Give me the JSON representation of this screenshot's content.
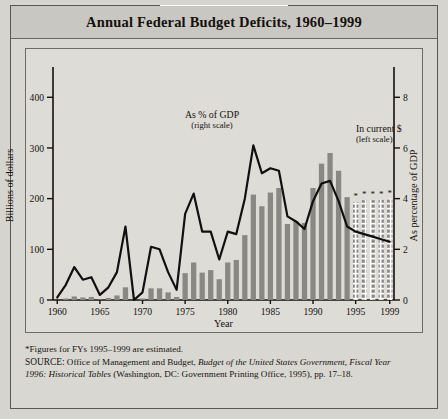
{
  "figure": {
    "title": "Annual Federal Budget Deficits, 1960–1999",
    "footnote": "*Figures for FYs 1995–1999 are estimated.",
    "source_label": "SOURCE:",
    "source_text_1": " Office of Management and Budget, ",
    "source_italic_1": "Budget of the United States Government, Fiscal Year",
    "source_italic_2": "1996: Historical Tables",
    "source_text_2": " (Washington, DC: Government Printing Office, 1995), pp. 17–18."
  },
  "annotations": {
    "line_label_1": "As % of GDP",
    "line_label_2": "(right scale)",
    "bar_label_1": "In current $",
    "bar_label_2": "(left scale)"
  },
  "colors": {
    "bar_fill": "#8a8884",
    "bar_estimated_fill": "#8a8884",
    "line_stroke": "#101010",
    "panel_bg": "#dedcd7",
    "frame": "#6e6c67",
    "title_bg": "#c9c7c2",
    "page_bg": "#d6d4cf"
  },
  "chart_data": {
    "type": "bar",
    "title": "Annual Federal Budget Deficits, 1960–1999",
    "xlabel": "Year",
    "ylabel": "Billions of dollars",
    "y2label": "As percentage of GDP",
    "ylim": [
      0,
      440
    ],
    "y2lim": [
      0,
      8.8
    ],
    "yticks": [
      0,
      100,
      200,
      300,
      400
    ],
    "y2ticks": [
      0,
      2,
      4,
      6,
      8
    ],
    "xticks": [
      1960,
      1965,
      1970,
      1975,
      1980,
      1985,
      1990,
      1995,
      1999
    ],
    "grid": false,
    "legend": "inline-annotations",
    "categories": [
      1960,
      1961,
      1962,
      1963,
      1964,
      1965,
      1966,
      1967,
      1968,
      1969,
      1970,
      1971,
      1972,
      1973,
      1974,
      1975,
      1976,
      1977,
      1978,
      1979,
      1980,
      1981,
      1982,
      1983,
      1984,
      1985,
      1986,
      1987,
      1988,
      1989,
      1990,
      1991,
      1992,
      1993,
      1994,
      1995,
      1996,
      1997,
      1998,
      1999
    ],
    "series": [
      {
        "name": "In current $ (left scale)",
        "axis": "left",
        "units": "Billions of dollars",
        "type": "bar",
        "values": [
          0,
          3,
          7,
          5,
          6,
          1,
          4,
          9,
          25,
          0,
          3,
          23,
          23,
          15,
          6,
          53,
          74,
          54,
          59,
          41,
          74,
          79,
          128,
          208,
          185,
          212,
          221,
          150,
          155,
          152,
          221,
          269,
          290,
          255,
          203,
          193,
          197,
          197,
          198,
          200
        ],
        "estimated_from": 1995
      },
      {
        "name": "As % of GDP (right scale)",
        "axis": "right",
        "units": "Percent of GDP",
        "type": "line",
        "values": [
          0.1,
          0.6,
          1.3,
          0.8,
          0.9,
          0.2,
          0.5,
          1.1,
          2.9,
          0.0,
          0.3,
          2.1,
          2.0,
          1.1,
          0.4,
          3.4,
          4.2,
          2.7,
          2.7,
          1.6,
          2.7,
          2.6,
          4.0,
          6.1,
          5.0,
          5.2,
          5.1,
          3.3,
          3.1,
          2.8,
          3.9,
          4.6,
          4.7,
          3.9,
          2.9,
          2.7,
          2.6,
          2.5,
          2.4,
          2.3
        ],
        "estimated_from": 1995
      }
    ]
  }
}
